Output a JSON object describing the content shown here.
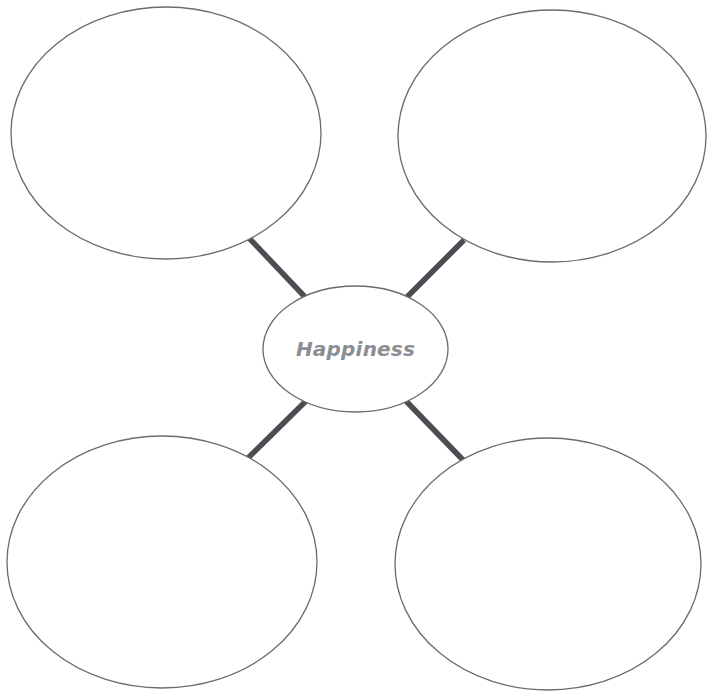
{
  "diagram": {
    "type": "spider-map",
    "center": {
      "label": "Happiness",
      "text_color": "#8a8e93"
    },
    "branches": [
      {
        "position": "top-left",
        "label": ""
      },
      {
        "position": "top-right",
        "label": ""
      },
      {
        "position": "bottom-left",
        "label": ""
      },
      {
        "position": "bottom-right",
        "label": ""
      }
    ],
    "colors": {
      "background": "#ffffff",
      "bubble_outline": "#6b6b6b",
      "connector": "#4a4d52"
    }
  }
}
